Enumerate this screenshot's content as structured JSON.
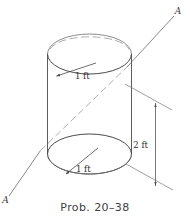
{
  "figure": {
    "caption": "Prob. 20–38",
    "axis_labels": {
      "top_right": "A",
      "bottom_left": "A"
    },
    "dimensions": {
      "top_radius": "1 ft",
      "bottom_radius": "1 ft",
      "height": "2 ft"
    },
    "colors": {
      "outline": "#4a4a4a",
      "hidden_edge": "#9a9a9a",
      "dimension": "#555555",
      "text": "#3a3a3a",
      "background": "#ffffff"
    }
  }
}
